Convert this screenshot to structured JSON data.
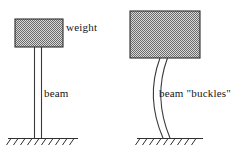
{
  "figure": {
    "background_color": "#ffffff",
    "stroke_color": "#303030",
    "hatch_fill_color": "#9a9a9a"
  },
  "labels": {
    "weight": "weight",
    "beam": "beam",
    "buckles": "beam \"buckles\""
  },
  "left_panel": {
    "name": "straight-beam-case",
    "weight_block": {
      "x": 15,
      "y": 19,
      "width": 48,
      "height": 28,
      "fill": "checker-gray"
    },
    "beam": {
      "type": "straight",
      "left_edge_x": 34,
      "right_edge_x": 41,
      "top_y": 47,
      "bottom_y": 138
    },
    "ground": {
      "x_start": 8,
      "x_end": 78,
      "y": 138,
      "hatch_count": 10
    }
  },
  "right_panel": {
    "name": "buckled-beam-case",
    "weight_block": {
      "x": 130,
      "y": 11,
      "width": 70,
      "height": 47,
      "fill": "checker-gray"
    },
    "beam": {
      "type": "buckled",
      "top_left_x": 160,
      "top_right_x": 168,
      "top_y": 58,
      "bottom_left_x": 163,
      "bottom_right_x": 170,
      "bottom_y": 138,
      "bow_direction": "left"
    },
    "ground": {
      "x_start": 137,
      "x_end": 203,
      "y": 138,
      "hatch_count": 9
    }
  }
}
